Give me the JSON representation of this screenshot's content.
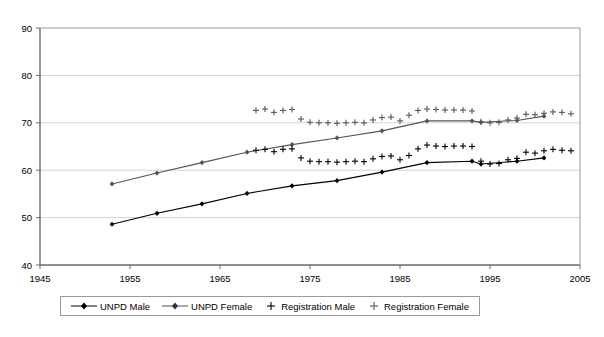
{
  "chart_data": {
    "type": "line",
    "title": "",
    "xlabel": "",
    "ylabel": "",
    "xlim": [
      1945,
      2005
    ],
    "ylim": [
      40,
      90
    ],
    "xticks": [
      1945,
      1955,
      1965,
      1975,
      1985,
      1995,
      2005
    ],
    "yticks": [
      40,
      50,
      60,
      70,
      80,
      90
    ],
    "grid": "horizontal",
    "legend_position": "bottom",
    "legend": [
      "UNPD Male",
      "UNPD Female",
      "Registration Male",
      "Registration Female"
    ],
    "series": [
      {
        "name": "UNPD Male",
        "marker": "diamond",
        "line": true,
        "color": "#000000",
        "points": [
          [
            1953,
            48.6
          ],
          [
            1958,
            50.9
          ],
          [
            1963,
            52.9
          ],
          [
            1968,
            55.1
          ],
          [
            1973,
            56.7
          ],
          [
            1978,
            57.8
          ],
          [
            1983,
            59.6
          ],
          [
            1988,
            61.6
          ],
          [
            1993,
            61.9
          ],
          [
            1994,
            61.3
          ],
          [
            1998,
            61.9
          ],
          [
            2001,
            62.6
          ]
        ]
      },
      {
        "name": "UNPD Female",
        "marker": "diamond",
        "line": true,
        "color": "#555555",
        "points": [
          [
            1953,
            57.1
          ],
          [
            1958,
            59.4
          ],
          [
            1963,
            61.6
          ],
          [
            1968,
            63.8
          ],
          [
            1973,
            65.4
          ],
          [
            1978,
            66.8
          ],
          [
            1983,
            68.3
          ],
          [
            1988,
            70.4
          ],
          [
            1993,
            70.4
          ],
          [
            1994,
            70.1
          ],
          [
            1998,
            70.5
          ],
          [
            2001,
            71.4
          ]
        ]
      },
      {
        "name": "Registration Male",
        "marker": "plus",
        "line": false,
        "color": "#000000",
        "points": [
          [
            1969,
            64.2
          ],
          [
            1970,
            64.4
          ],
          [
            1971,
            63.9
          ],
          [
            1972,
            64.4
          ],
          [
            1973,
            64.5
          ],
          [
            1974,
            62.6
          ],
          [
            1975,
            61.9
          ],
          [
            1976,
            61.8
          ],
          [
            1977,
            61.8
          ],
          [
            1978,
            61.7
          ],
          [
            1979,
            61.8
          ],
          [
            1980,
            61.9
          ],
          [
            1981,
            61.8
          ],
          [
            1982,
            62.4
          ],
          [
            1983,
            62.9
          ],
          [
            1984,
            63.0
          ],
          [
            1985,
            62.2
          ],
          [
            1986,
            63.1
          ],
          [
            1987,
            64.5
          ],
          [
            1988,
            65.3
          ],
          [
            1989,
            65.1
          ],
          [
            1990,
            65.0
          ],
          [
            1991,
            65.1
          ],
          [
            1992,
            65.1
          ],
          [
            1993,
            65.0
          ],
          [
            1994,
            61.9
          ],
          [
            1995,
            61.3
          ],
          [
            1996,
            61.4
          ],
          [
            1997,
            62.2
          ],
          [
            1998,
            62.5
          ],
          [
            1999,
            63.8
          ],
          [
            2000,
            63.6
          ],
          [
            2001,
            64.1
          ],
          [
            2002,
            64.4
          ],
          [
            2003,
            64.2
          ],
          [
            2004,
            64.1
          ]
        ]
      },
      {
        "name": "Registration Female",
        "marker": "plus",
        "line": false,
        "color": "#555555",
        "points": [
          [
            1969,
            72.6
          ],
          [
            1970,
            72.9
          ],
          [
            1971,
            72.2
          ],
          [
            1972,
            72.6
          ],
          [
            1973,
            72.8
          ],
          [
            1974,
            70.8
          ],
          [
            1975,
            70.1
          ],
          [
            1976,
            70.0
          ],
          [
            1977,
            70.0
          ],
          [
            1978,
            69.9
          ],
          [
            1979,
            70.0
          ],
          [
            1980,
            70.1
          ],
          [
            1981,
            70.0
          ],
          [
            1982,
            70.6
          ],
          [
            1983,
            71.1
          ],
          [
            1984,
            71.2
          ],
          [
            1985,
            70.4
          ],
          [
            1986,
            71.6
          ],
          [
            1987,
            72.6
          ],
          [
            1988,
            72.9
          ],
          [
            1989,
            72.8
          ],
          [
            1990,
            72.7
          ],
          [
            1991,
            72.7
          ],
          [
            1992,
            72.7
          ],
          [
            1993,
            72.5
          ],
          [
            1994,
            70.2
          ],
          [
            1995,
            70.0
          ],
          [
            1996,
            70.1
          ],
          [
            1997,
            70.6
          ],
          [
            1998,
            71.0
          ],
          [
            1999,
            71.8
          ],
          [
            2000,
            71.7
          ],
          [
            2001,
            72.0
          ],
          [
            2002,
            72.3
          ],
          [
            2003,
            72.2
          ],
          [
            2004,
            71.9
          ]
        ]
      }
    ]
  },
  "legend": {
    "items": [
      {
        "label": "UNPD Male",
        "marker": "diamond-line",
        "color": "#000000"
      },
      {
        "label": "UNPD Female",
        "marker": "diamond-line",
        "color": "#555555"
      },
      {
        "label": "Registration Male",
        "marker": "plus",
        "color": "#000000"
      },
      {
        "label": "Registration Female",
        "marker": "plus",
        "color": "#555555"
      }
    ]
  }
}
